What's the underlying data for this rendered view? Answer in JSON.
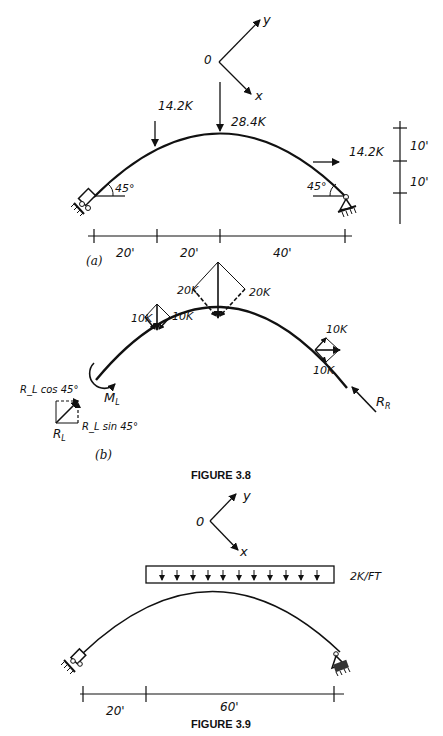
{
  "figure_3_8": {
    "caption": "FIGURE 3.8",
    "part_a": {
      "label": "(a)",
      "axes": {
        "origin": "0",
        "x": "x",
        "y": "y"
      },
      "loads": {
        "left_load": "14.2K",
        "center_load": "28.4K",
        "right_load": "14.2K"
      },
      "angles": {
        "left": "45°",
        "right": "45°"
      },
      "horizontal_dims": [
        "20'",
        "20'",
        "40'"
      ],
      "vertical_dims": [
        "10'",
        "10'"
      ]
    },
    "part_b": {
      "label": "(b)",
      "left_components": [
        "10K",
        "10K"
      ],
      "center_components": [
        "20K",
        "20K"
      ],
      "right_components": [
        "10K",
        "10K"
      ],
      "moment": "M_L",
      "moment_sub": "L",
      "moment_main": "M",
      "reaction_left": "R",
      "reaction_left_sub": "L",
      "reaction_left_cos": "R_L cos 45°",
      "reaction_left_sin": "R_L sin 45°",
      "reaction_right": "R",
      "reaction_right_sub": "R"
    }
  },
  "figure_3_9": {
    "caption": "FIGURE 3.9",
    "axes": {
      "origin": "0",
      "x": "x",
      "y": "y"
    },
    "distributed_load": "2K/FT",
    "horizontal_dims": [
      "20'",
      "60'"
    ]
  }
}
